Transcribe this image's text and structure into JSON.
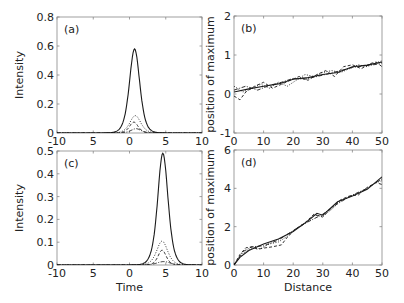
{
  "figure": {
    "width": 404,
    "height": 303,
    "line_color": "#1a1a1a",
    "frame_color": "#888888"
  },
  "chart_data": [
    {
      "id": "a",
      "panel_label": "(a)",
      "type": "line",
      "xlabel": "",
      "ylabel": "Intensity",
      "xlim": [
        -10,
        10
      ],
      "ylim": [
        0,
        0.8
      ],
      "xticks": [
        -10,
        -5,
        0,
        5,
        10
      ],
      "xtick_labels": [
        "-10",
        "5",
        "0",
        "5",
        "10"
      ],
      "yticks": [
        0,
        0.2,
        0.4,
        0.6,
        0.8
      ],
      "ytick_labels": [
        "0",
        "0.2",
        "0.4",
        "0.6",
        "0.8"
      ],
      "box": {
        "x0": 57,
        "y0": 17,
        "x1": 202,
        "y1": 133
      },
      "series": [
        {
          "name": "solid",
          "style": "solid",
          "shape": "sech2",
          "center": 0.7,
          "amplitude": 0.58,
          "width": 0.95
        },
        {
          "name": "dotted",
          "style": "dotted",
          "shape": "sech2",
          "center": 0.8,
          "amplitude": 0.12,
          "width": 1.0
        },
        {
          "name": "dashed",
          "style": "dashed",
          "shape": "sech2",
          "center": 0.6,
          "amplitude": 0.075,
          "width": 0.8
        },
        {
          "name": "dashdot",
          "style": "dashdot",
          "shape": "sech2",
          "center": 0.9,
          "amplitude": 0.03,
          "width": 0.9
        }
      ]
    },
    {
      "id": "b",
      "panel_label": "(b)",
      "type": "line",
      "xlabel": "",
      "ylabel": "position of maximum",
      "xlim": [
        0,
        50
      ],
      "ylim": [
        -1,
        2
      ],
      "xticks": [
        0,
        10,
        20,
        30,
        40,
        50
      ],
      "xtick_labels": [
        "0",
        "10",
        "20",
        "30",
        "40",
        "50"
      ],
      "yticks": [
        -1,
        0,
        1,
        2
      ],
      "ytick_labels": [
        "-1",
        "0",
        "1",
        "2"
      ],
      "box": {
        "x0": 234,
        "y0": 16,
        "x1": 382,
        "y1": 133
      },
      "series": [
        {
          "name": "solid",
          "style": "solid",
          "x": [
            0,
            5,
            10,
            15,
            20,
            25,
            30,
            35,
            40,
            45,
            50
          ],
          "y": [
            0.05,
            0.13,
            0.2,
            0.26,
            0.38,
            0.42,
            0.5,
            0.55,
            0.7,
            0.74,
            0.82
          ]
        },
        {
          "name": "dotted",
          "style": "dotted",
          "x": [
            0,
            3,
            6,
            9,
            12,
            15,
            18,
            21,
            24,
            27,
            30,
            33,
            36,
            39,
            42,
            45,
            48,
            50
          ],
          "y": [
            0.2,
            0.05,
            0.15,
            0.25,
            0.15,
            0.3,
            0.2,
            0.35,
            0.5,
            0.45,
            0.55,
            0.6,
            0.55,
            0.65,
            0.75,
            0.7,
            0.8,
            0.85
          ]
        },
        {
          "name": "dashed",
          "style": "dashed",
          "x": [
            0,
            2,
            4,
            7,
            10,
            13,
            16,
            19,
            22,
            25,
            28,
            31,
            34,
            37,
            40,
            43,
            46,
            48,
            50
          ],
          "y": [
            -0.05,
            -0.15,
            0.05,
            0.2,
            0.3,
            0.15,
            0.25,
            0.35,
            0.45,
            0.35,
            0.5,
            0.6,
            0.45,
            0.7,
            0.75,
            0.65,
            0.78,
            0.82,
            0.7
          ]
        },
        {
          "name": "dashdot",
          "style": "dashdot",
          "x": [
            0,
            4,
            8,
            12,
            16,
            20,
            24,
            28,
            32,
            36,
            40,
            44,
            48,
            50
          ],
          "y": [
            0.1,
            0.2,
            0.1,
            0.22,
            0.3,
            0.4,
            0.38,
            0.45,
            0.52,
            0.6,
            0.68,
            0.72,
            0.76,
            0.8
          ]
        }
      ]
    },
    {
      "id": "c",
      "panel_label": "(c)",
      "type": "line",
      "xlabel": "Time",
      "ylabel": "Intensity",
      "xlim": [
        -10,
        10
      ],
      "ylim": [
        0,
        0.5
      ],
      "xticks": [
        -10,
        -5,
        0,
        5,
        10
      ],
      "xtick_labels": [
        "-10",
        "5",
        "0",
        "5",
        "10"
      ],
      "yticks": [
        0,
        0.1,
        0.2,
        0.3,
        0.4,
        0.5
      ],
      "ytick_labels": [
        "0",
        "0.1",
        "0.2",
        "0.3",
        "0.4",
        "0.5"
      ],
      "box": {
        "x0": 57,
        "y0": 151,
        "x1": 202,
        "y1": 265
      },
      "series": [
        {
          "name": "solid",
          "style": "solid",
          "shape": "sech2",
          "center": 4.6,
          "amplitude": 0.49,
          "width": 0.95
        },
        {
          "name": "dotted",
          "style": "dotted",
          "shape": "sech2",
          "center": 4.5,
          "amplitude": 0.105,
          "width": 1.0
        },
        {
          "name": "dashed",
          "style": "dashed",
          "shape": "sech2",
          "center": 4.5,
          "amplitude": 0.065,
          "width": 0.75
        },
        {
          "name": "dashdot",
          "style": "dashdot",
          "shape": "sech2",
          "center": 4.7,
          "amplitude": 0.015,
          "width": 1.2
        }
      ]
    },
    {
      "id": "d",
      "panel_label": "(d)",
      "type": "line",
      "xlabel": "Distance",
      "ylabel": "position of maximum",
      "xlim": [
        0,
        50
      ],
      "ylim": [
        0,
        6
      ],
      "xticks": [
        0,
        10,
        20,
        30,
        40,
        50
      ],
      "xtick_labels": [
        "0",
        "10",
        "20",
        "30",
        "40",
        "50"
      ],
      "yticks": [
        0,
        2,
        4,
        6
      ],
      "ytick_labels": [
        "0",
        "2",
        "4",
        "6"
      ],
      "box": {
        "x0": 234,
        "y0": 150,
        "x1": 382,
        "y1": 265
      },
      "series": [
        {
          "name": "solid",
          "style": "solid",
          "x": [
            0,
            2,
            5,
            10,
            15,
            20,
            25,
            28,
            30,
            35,
            40,
            45,
            50
          ],
          "y": [
            0,
            0.4,
            0.75,
            1.1,
            1.35,
            1.75,
            2.3,
            2.7,
            2.6,
            3.3,
            3.6,
            3.95,
            4.6
          ]
        },
        {
          "name": "dotted",
          "style": "dotted",
          "x": [
            0,
            3,
            6,
            9,
            12,
            15,
            18,
            21,
            24,
            27,
            30,
            33,
            36,
            39,
            42,
            45,
            48,
            50
          ],
          "y": [
            0.05,
            0.6,
            0.9,
            0.85,
            1.1,
            1.2,
            1.5,
            1.9,
            2.2,
            2.6,
            2.55,
            2.9,
            3.35,
            3.55,
            3.75,
            4.0,
            4.3,
            4.4
          ]
        },
        {
          "name": "dashed",
          "style": "dashed",
          "x": [
            0,
            2,
            4,
            6,
            8,
            10,
            13,
            16,
            18,
            21,
            24,
            27,
            30,
            33,
            36,
            39,
            42,
            45,
            48,
            50
          ],
          "y": [
            0,
            0.55,
            0.9,
            0.95,
            0.82,
            0.88,
            0.95,
            1.05,
            1.45,
            1.9,
            2.2,
            2.65,
            2.5,
            3.0,
            3.4,
            3.6,
            3.65,
            4.05,
            4.3,
            4.2
          ]
        },
        {
          "name": "dashdot",
          "style": "dashdot",
          "x": [
            0,
            3,
            6,
            10,
            15,
            20,
            25,
            30,
            35,
            40,
            45,
            50
          ],
          "y": [
            0,
            0.7,
            0.95,
            1.0,
            1.3,
            1.8,
            2.25,
            2.65,
            3.2,
            3.65,
            4.0,
            4.5
          ]
        }
      ]
    }
  ]
}
